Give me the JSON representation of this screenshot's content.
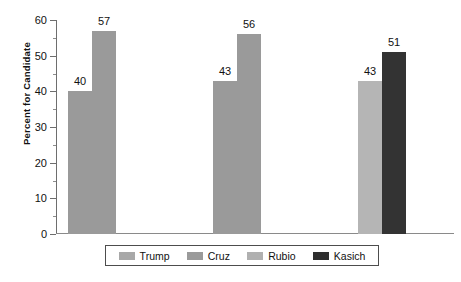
{
  "chart_data": {
    "type": "bar",
    "title": "",
    "subtitle": "",
    "xlabel": "",
    "ylabel": "Percent for Candidate",
    "ylim": [
      0,
      60
    ],
    "ytick_labels": [
      "0",
      "10",
      "20",
      "30",
      "40",
      "50",
      "60"
    ],
    "ytick_values": [
      0,
      10,
      20,
      30,
      40,
      50,
      60
    ],
    "minor_tick_values": [
      5,
      15,
      25,
      35,
      45,
      55
    ],
    "grid": false,
    "legend_position": "bottom",
    "categories": [
      "Group 1",
      "Group 2",
      "Group 3"
    ],
    "series": [
      {
        "name": "Trump",
        "color": "#9a9a9a",
        "values": [
          40,
          43,
          null
        ]
      },
      {
        "name": "Cruz",
        "color": "#9a9a9a",
        "values": [
          57,
          56,
          null
        ]
      },
      {
        "name": "Rubio",
        "color": "#b5b5b5",
        "values": [
          null,
          null,
          43
        ]
      },
      {
        "name": "Kasich",
        "color": "#333333",
        "values": [
          null,
          null,
          51
        ]
      }
    ],
    "bars": [
      {
        "name": "Trump",
        "value": 40,
        "label": "40",
        "color": "#9a9a9a",
        "left": 12,
        "width": 24
      },
      {
        "name": "Cruz",
        "value": 57,
        "label": "57",
        "color": "#9a9a9a",
        "left": 36,
        "width": 24
      },
      {
        "name": "Trump",
        "value": 43,
        "label": "43",
        "color": "#9a9a9a",
        "left": 157,
        "width": 24
      },
      {
        "name": "Cruz",
        "value": 56,
        "label": "56",
        "color": "#9a9a9a",
        "left": 181,
        "width": 24
      },
      {
        "name": "Rubio",
        "value": 43,
        "label": "43",
        "color": "#b5b5b5",
        "left": 302,
        "width": 24
      },
      {
        "name": "Kasich",
        "value": 51,
        "label": "51",
        "color": "#333333",
        "left": 326,
        "width": 24
      }
    ],
    "legend": [
      {
        "label": "Trump",
        "color": "#a8a8a8"
      },
      {
        "label": "Cruz",
        "color": "#9a9a9a"
      },
      {
        "label": "Rubio",
        "color": "#b0b0b0"
      },
      {
        "label": "Kasich",
        "color": "#2e2e2e"
      }
    ]
  }
}
